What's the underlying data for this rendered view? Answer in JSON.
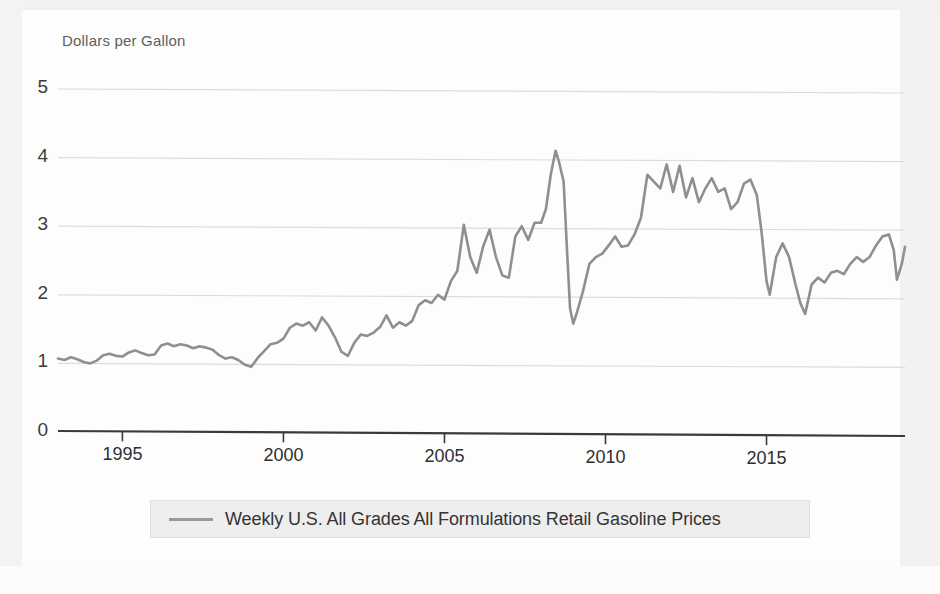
{
  "chart_data": {
    "type": "line",
    "title": "",
    "subtitle": "",
    "xlabel": "",
    "ylabel": "Dollars per Gallon",
    "ylim": [
      0,
      5
    ],
    "xlim": [
      1993,
      2019.3
    ],
    "grid": true,
    "grid_lines": [
      1,
      2,
      3,
      4,
      5
    ],
    "legend_position": "bottom-center",
    "yticks": [
      "0",
      "1",
      "2",
      "3",
      "4",
      "5"
    ],
    "ytick_values": [
      0,
      1,
      2,
      3,
      4,
      5
    ],
    "xticks": [
      "1995",
      "2000",
      "2005",
      "2010",
      "2015"
    ],
    "xtick_values": [
      1995,
      2000,
      2005,
      2010,
      2015
    ],
    "line_color": "#8f8f8f",
    "series": [
      {
        "name": "Weekly U.S. All Grades All Formulations Retail Gasoline Prices",
        "color": "#8f8f8f",
        "x": [
          1993.0,
          1993.2,
          1993.4,
          1993.6,
          1993.8,
          1994.0,
          1994.2,
          1994.4,
          1994.6,
          1994.8,
          1995.0,
          1995.2,
          1995.4,
          1995.6,
          1995.8,
          1996.0,
          1996.2,
          1996.4,
          1996.6,
          1996.8,
          1997.0,
          1997.2,
          1997.4,
          1997.6,
          1997.8,
          1998.0,
          1998.2,
          1998.4,
          1998.6,
          1998.8,
          1999.0,
          1999.2,
          1999.4,
          1999.6,
          1999.8,
          2000.0,
          2000.2,
          2000.4,
          2000.6,
          2000.8,
          2001.0,
          2001.2,
          2001.4,
          2001.6,
          2001.8,
          2002.0,
          2002.2,
          2002.4,
          2002.6,
          2002.8,
          2003.0,
          2003.2,
          2003.4,
          2003.6,
          2003.8,
          2004.0,
          2004.2,
          2004.4,
          2004.6,
          2004.8,
          2005.0,
          2005.2,
          2005.4,
          2005.6,
          2005.8,
          2006.0,
          2006.2,
          2006.4,
          2006.6,
          2006.8,
          2007.0,
          2007.2,
          2007.4,
          2007.6,
          2007.8,
          2008.0,
          2008.15,
          2008.3,
          2008.45,
          2008.55,
          2008.7,
          2008.8,
          2008.9,
          2009.0,
          2009.1,
          2009.3,
          2009.5,
          2009.7,
          2009.9,
          2010.1,
          2010.3,
          2010.5,
          2010.7,
          2010.9,
          2011.1,
          2011.3,
          2011.5,
          2011.7,
          2011.9,
          2012.1,
          2012.3,
          2012.5,
          2012.7,
          2012.9,
          2013.1,
          2013.3,
          2013.5,
          2013.7,
          2013.9,
          2014.1,
          2014.3,
          2014.5,
          2014.7,
          2014.85,
          2015.0,
          2015.1,
          2015.3,
          2015.5,
          2015.7,
          2015.9,
          2016.05,
          2016.2,
          2016.4,
          2016.6,
          2016.8,
          2017.0,
          2017.2,
          2017.4,
          2017.6,
          2017.8,
          2018.0,
          2018.2,
          2018.4,
          2018.6,
          2018.8,
          2018.95,
          2019.05,
          2019.2,
          2019.3
        ],
        "y": [
          1.07,
          1.05,
          1.09,
          1.06,
          1.02,
          1.0,
          1.04,
          1.12,
          1.14,
          1.11,
          1.1,
          1.16,
          1.19,
          1.15,
          1.12,
          1.13,
          1.26,
          1.29,
          1.25,
          1.28,
          1.26,
          1.22,
          1.25,
          1.23,
          1.2,
          1.12,
          1.07,
          1.09,
          1.05,
          0.98,
          0.95,
          1.08,
          1.18,
          1.28,
          1.3,
          1.36,
          1.52,
          1.58,
          1.55,
          1.6,
          1.48,
          1.67,
          1.55,
          1.38,
          1.17,
          1.11,
          1.3,
          1.42,
          1.4,
          1.45,
          1.53,
          1.7,
          1.52,
          1.6,
          1.55,
          1.62,
          1.85,
          1.92,
          1.88,
          2.0,
          1.93,
          2.2,
          2.35,
          3.02,
          2.55,
          2.32,
          2.7,
          2.95,
          2.55,
          2.28,
          2.25,
          2.85,
          3.0,
          2.8,
          3.05,
          3.05,
          3.25,
          3.75,
          4.1,
          3.95,
          3.65,
          2.7,
          1.8,
          1.58,
          1.72,
          2.05,
          2.45,
          2.55,
          2.6,
          2.72,
          2.85,
          2.7,
          2.72,
          2.88,
          3.12,
          3.75,
          3.65,
          3.55,
          3.9,
          3.5,
          3.88,
          3.42,
          3.7,
          3.35,
          3.55,
          3.7,
          3.5,
          3.55,
          3.25,
          3.35,
          3.62,
          3.68,
          3.45,
          2.9,
          2.2,
          2.0,
          2.55,
          2.75,
          2.55,
          2.15,
          1.88,
          1.72,
          2.15,
          2.25,
          2.18,
          2.32,
          2.35,
          2.3,
          2.45,
          2.55,
          2.48,
          2.55,
          2.72,
          2.85,
          2.88,
          2.65,
          2.22,
          2.45,
          2.7
        ]
      }
    ]
  },
  "legend": {
    "label": "Weekly U.S. All Grades All Formulations Retail Gasoline Prices"
  }
}
